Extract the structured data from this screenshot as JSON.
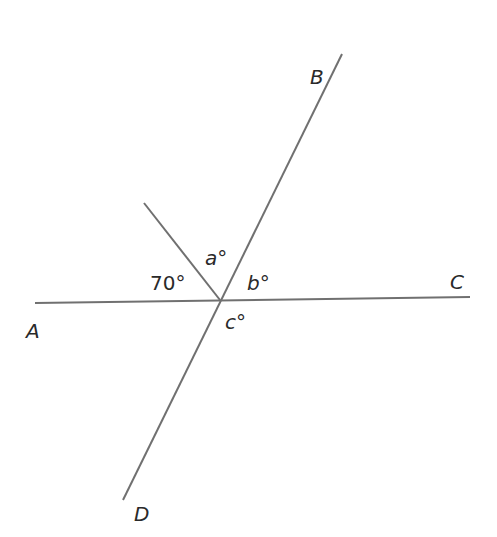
{
  "diagram": {
    "type": "geometry-angles",
    "colors": {
      "line": "#707070",
      "text": "#2a2a2a",
      "background": "#ffffff"
    },
    "points": {
      "A": {
        "label": "A"
      },
      "B": {
        "label": "B"
      },
      "C": {
        "label": "C"
      },
      "D": {
        "label": "D"
      }
    },
    "lines": [
      {
        "name": "AC",
        "from": "A",
        "to": "C"
      },
      {
        "name": "BD",
        "from": "B",
        "to": "D"
      },
      {
        "name": "ray",
        "from": "intersection",
        "to": "upper-left"
      }
    ],
    "angles": {
      "given": {
        "value": "70",
        "text": "70°"
      },
      "a": {
        "var": "a",
        "text": "a°"
      },
      "b": {
        "var": "b",
        "text": "b°"
      },
      "c": {
        "var": "c",
        "text": "c°"
      }
    }
  }
}
